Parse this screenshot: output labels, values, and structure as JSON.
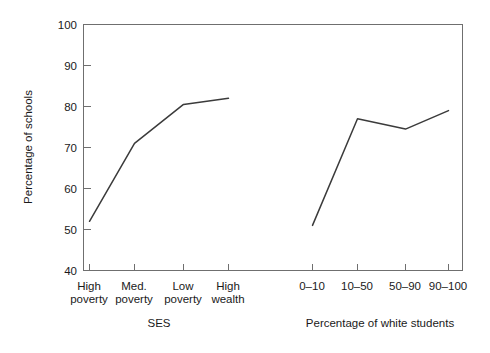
{
  "chart_data": {
    "type": "line",
    "title": "",
    "subtitle": "",
    "ylabel": "Percentage of schools",
    "ylim": [
      40,
      100
    ],
    "yticks": [
      40,
      50,
      60,
      70,
      80,
      90,
      100
    ],
    "ytick_labels": [
      "40",
      "50",
      "60",
      "70",
      "80",
      "90",
      "100"
    ],
    "grid": false,
    "legend": "none",
    "panels": [
      {
        "name": "ses-panel",
        "xlabel": "SES",
        "categories": [
          "High poverty",
          "Med. poverty",
          "Low poverty",
          "High wealth"
        ],
        "category_lines": [
          [
            "High",
            "poverty"
          ],
          [
            "Med.",
            "poverty"
          ],
          [
            "Low",
            "poverty"
          ],
          [
            "High",
            "wealth"
          ]
        ],
        "series": [
          {
            "name": "Percentage of schools",
            "values": [
              52,
              71,
              80.5,
              82
            ]
          }
        ]
      },
      {
        "name": "white-students-panel",
        "xlabel": "Percentage of white students",
        "categories": [
          "0–10",
          "10–50",
          "50–90",
          "90–100"
        ],
        "category_lines": [
          [
            "0–10"
          ],
          [
            "10–50"
          ],
          [
            "50–90"
          ],
          [
            "90–100"
          ]
        ],
        "series": [
          {
            "name": "Percentage of schools",
            "values": [
              51,
              77,
              74.5,
              79
            ]
          }
        ]
      }
    ],
    "colors": {
      "line": "#3b3b3b",
      "axis": "#6f6f6f",
      "text": "#1a1a1a",
      "background": "#ffffff"
    }
  },
  "axis": {
    "ylabel": "Percentage of schools",
    "ytick_labels": [
      "100",
      "90",
      "80",
      "70",
      "60",
      "50",
      "40"
    ],
    "left_xlabel": "SES",
    "right_xlabel": "Percentage of white students",
    "left_xtick_line1": [
      "High",
      "Med.",
      "Low",
      "High"
    ],
    "left_xtick_line2": [
      "poverty",
      "poverty",
      "poverty",
      "wealth"
    ],
    "right_xtick_labels": [
      "0–10",
      "10–50",
      "50–90",
      "90–100"
    ]
  }
}
